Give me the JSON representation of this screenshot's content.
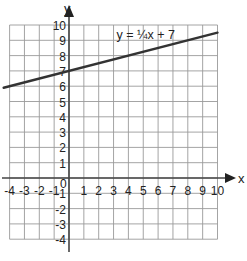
{
  "chart_data": {
    "type": "line",
    "title": "",
    "xlabel": "x",
    "ylabel": "y",
    "xlim": [
      -4,
      10
    ],
    "ylim": [
      -4,
      10
    ],
    "grid": true,
    "x_ticks": [
      "-4",
      "-3",
      "-2",
      "-1",
      "1",
      "2",
      "3",
      "4",
      "5",
      "6",
      "7",
      "8",
      "9",
      "10"
    ],
    "y_ticks": [
      "10",
      "9",
      "8",
      "7",
      "6",
      "5",
      "4",
      "3",
      "2",
      "1",
      "-1",
      "-2",
      "-3",
      "-4"
    ],
    "origin_label": "0",
    "series": [
      {
        "name": "y = ¼x + 7",
        "equation": "y = 0.25x + 7",
        "slope": 0.25,
        "intercept": 7,
        "x": [
          -4.4,
          10
        ],
        "y": [
          5.9,
          9.5
        ],
        "color": "#333333"
      }
    ],
    "annotations": [
      {
        "text": "y = ¼x + 7",
        "x": 3.2,
        "y": 9.1
      }
    ]
  }
}
